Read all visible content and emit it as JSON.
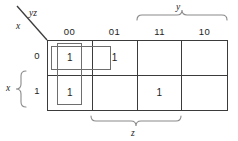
{
  "diagram": {
    "type": "karnaugh-map",
    "corner": {
      "columns_label": "yz",
      "rows_label": "x",
      "divider_icon": "diagonal-line-icon"
    },
    "column_headers": [
      "00",
      "01",
      "11",
      "10"
    ],
    "row_headers": [
      "0",
      "1"
    ],
    "cells": [
      {
        "row": "0",
        "col": "00",
        "value": "1"
      },
      {
        "row": "0",
        "col": "01",
        "value": "1"
      },
      {
        "row": "0",
        "col": "11",
        "value": ""
      },
      {
        "row": "0",
        "col": "10",
        "value": ""
      },
      {
        "row": "1",
        "col": "00",
        "value": "1"
      },
      {
        "row": "1",
        "col": "01",
        "value": ""
      },
      {
        "row": "1",
        "col": "11",
        "value": "1"
      },
      {
        "row": "1",
        "col": "10",
        "value": ""
      }
    ],
    "braces": [
      {
        "name": "y",
        "label": "y",
        "position": "top",
        "spans": [
          "11",
          "10"
        ]
      },
      {
        "name": "z",
        "label": "z",
        "position": "bottom",
        "spans": [
          "01",
          "11"
        ]
      },
      {
        "name": "x",
        "label": "x",
        "position": "left",
        "spans": [
          "1"
        ]
      }
    ],
    "groups": [
      {
        "name": "horizontal-group",
        "cells": [
          "0-00",
          "0-01"
        ]
      },
      {
        "name": "vertical-group",
        "cells": [
          "0-00",
          "1-00"
        ]
      }
    ],
    "colors": {
      "grid_line": "#3b3b3b",
      "group_outline": "#6e6e6e",
      "brace_line": "#808080",
      "text": "#1d1d1d",
      "background": "#ffffff"
    }
  }
}
